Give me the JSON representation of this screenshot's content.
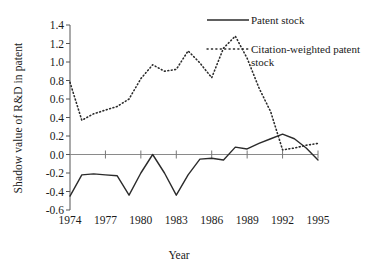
{
  "chart_data": {
    "type": "line",
    "title": "",
    "xlabel": "Year",
    "ylabel": "Shadow value of R&D in patent",
    "xlim": [
      1974,
      1995
    ],
    "ylim": [
      -0.6,
      1.4
    ],
    "ytick_labels": [
      "1.4",
      "1.2",
      "1.0",
      "0.8",
      "0.6",
      "0.4",
      "0.2",
      "0.0",
      "-0.2",
      "-0.4",
      "-0.6"
    ],
    "ytick_values": [
      1.4,
      1.2,
      1.0,
      0.8,
      0.6,
      0.4,
      0.2,
      0.0,
      -0.2,
      -0.4,
      -0.6
    ],
    "xtick_labels": [
      "1974",
      "1977",
      "1980",
      "1983",
      "1986",
      "1989",
      "1992",
      "1995"
    ],
    "xtick_values": [
      1974,
      1977,
      1980,
      1983,
      1986,
      1989,
      1992,
      1995
    ],
    "grid": false,
    "zero_line": true,
    "legend_position": "top-right",
    "x": [
      1974,
      1975,
      1976,
      1977,
      1978,
      1979,
      1980,
      1981,
      1982,
      1983,
      1984,
      1985,
      1986,
      1987,
      1988,
      1989,
      1990,
      1991,
      1992,
      1993,
      1994,
      1995
    ],
    "series": [
      {
        "name": "Patent stock",
        "style": "solid",
        "color": "#2b2b2b",
        "values": [
          -0.45,
          -0.22,
          -0.21,
          -0.22,
          -0.23,
          -0.44,
          -0.2,
          0.0,
          -0.2,
          -0.44,
          -0.22,
          -0.05,
          -0.04,
          -0.06,
          0.08,
          0.06,
          0.12,
          0.17,
          0.22,
          0.17,
          0.07,
          -0.06
        ]
      },
      {
        "name": "Citation-weighted patent stock",
        "style": "dotted",
        "color": "#2b2b2b",
        "values": [
          0.78,
          0.37,
          0.44,
          0.48,
          0.52,
          0.6,
          0.82,
          0.97,
          0.9,
          0.92,
          1.12,
          0.99,
          0.83,
          1.15,
          1.28,
          1.04,
          0.72,
          0.46,
          0.38,
          0.4,
          0.58,
          0.62
        ]
      }
    ],
    "series2_display_values": [
      0.78,
      0.37,
      0.44,
      0.48,
      0.52,
      0.6,
      0.82,
      0.97,
      0.9,
      0.92,
      1.12,
      0.99,
      0.83,
      1.15,
      1.28,
      1.04,
      0.72,
      0.46,
      0.05,
      0.07,
      0.1,
      0.12
    ]
  },
  "legend": {
    "items": [
      {
        "label": "Patent stock",
        "style": "solid"
      },
      {
        "label": "Citation-weighted patent stock",
        "style": "dotted"
      }
    ]
  }
}
